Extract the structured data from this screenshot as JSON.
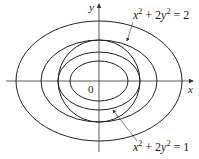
{
  "diagram": {
    "axes": {
      "x_label": "x",
      "y_label": "y",
      "origin_label": "0"
    },
    "curves": [
      {
        "name": "outer-ellipse",
        "kind": "ellipse",
        "rx": 83,
        "ry": 60
      },
      {
        "name": "ellipse-x2-2y2-eq-2",
        "kind": "ellipse",
        "rx": 58,
        "ry": 41
      },
      {
        "name": "circle",
        "kind": "circle",
        "r": 41
      },
      {
        "name": "ellipse-x2-2y2-eq-1",
        "kind": "ellipse",
        "rx": 41,
        "ry": 29
      },
      {
        "name": "inner-ellipse",
        "kind": "ellipse",
        "rx": 29,
        "ry": 20
      }
    ],
    "labels": {
      "top": {
        "lhs_x": "x",
        "sup1": "2",
        "mid": " + 2",
        "lhs_y": "y",
        "sup2": "2",
        "rhs": " = 2"
      },
      "bottom": {
        "lhs_x": "x",
        "sup1": "2",
        "mid": " + 2",
        "lhs_y": "y",
        "sup2": "2",
        "rhs": " = 1"
      }
    },
    "colors": {
      "stroke": "#222222",
      "background": "#ffffff"
    }
  }
}
